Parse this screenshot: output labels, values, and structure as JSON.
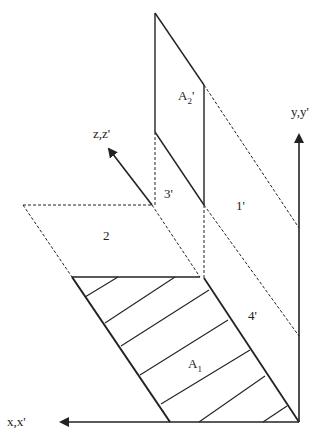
{
  "diagram": {
    "labels": {
      "a2_prime": "A",
      "a2_prime_sub": "2",
      "a2_prime_suffix": "'",
      "a1": "A",
      "a1_sub": "1",
      "region_1_prime": "1'",
      "region_2": "2",
      "region_3_prime": "3'",
      "region_4_prime": "4'",
      "axis_y": "y,y'",
      "axis_z": "z,z'",
      "axis_x": "x,x'"
    },
    "colors": {
      "stroke": "#222222",
      "background": "#ffffff"
    }
  }
}
